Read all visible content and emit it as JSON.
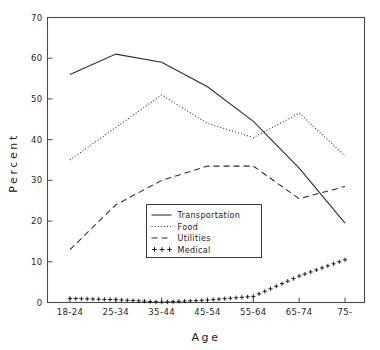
{
  "chart_data": {
    "type": "line",
    "title": "",
    "xlabel": "Age",
    "ylabel": "Percent",
    "categories": [
      "18-24",
      "25-34",
      "35-44",
      "45-54",
      "55-64",
      "65-74",
      "75-"
    ],
    "xlim": [
      0,
      6
    ],
    "ylim": [
      0,
      70
    ],
    "yticks": [
      0,
      10,
      20,
      30,
      40,
      50,
      60,
      70
    ],
    "grid": false,
    "legend_position": "center",
    "series": [
      {
        "name": "Transportation",
        "style": "solid",
        "marker": "none",
        "values": [
          56.0,
          61.0,
          59.0,
          53.0,
          44.5,
          33.0,
          19.5
        ]
      },
      {
        "name": "Food",
        "style": "dotted",
        "marker": "none",
        "values": [
          35.0,
          43.0,
          51.0,
          44.0,
          40.5,
          46.5,
          36.0
        ]
      },
      {
        "name": "Utilities",
        "style": "dashed",
        "marker": "none",
        "values": [
          13.0,
          24.0,
          30.0,
          33.5,
          33.5,
          25.5,
          28.5
        ]
      },
      {
        "name": "Medical",
        "style": "none",
        "marker": "plus",
        "values": [
          1.0,
          0.7,
          0.1,
          0.6,
          1.5,
          6.5,
          10.5
        ]
      }
    ]
  },
  "legend": {
    "entries": [
      {
        "label": "Transportation",
        "swatch": "solid-line"
      },
      {
        "label": "Food",
        "swatch": "dotted-line"
      },
      {
        "label": "Utilities",
        "swatch": "dashed-line"
      },
      {
        "label": "Medical",
        "swatch": "plus-markers"
      }
    ]
  },
  "axes": {
    "y_tick_labels": [
      "0",
      "10",
      "20",
      "30",
      "40",
      "50",
      "60",
      "70"
    ],
    "x_tick_labels": [
      "18-24",
      "25-34",
      "35-44",
      "45-54",
      "55-64",
      "65-74",
      "75-"
    ],
    "x_axis_title": "Age",
    "y_axis_title": "Percent"
  },
  "colors": {
    "ink": "#2b2b2b",
    "axis": "#4a4a4a",
    "background": "#ffffff"
  }
}
